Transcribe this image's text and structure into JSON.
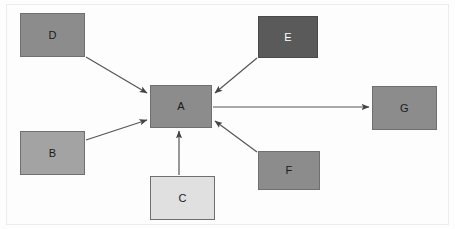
{
  "diagram": {
    "type": "node-link-graph",
    "title": "",
    "canvas": {
      "width": 455,
      "height": 229,
      "background": "#fdfdfd",
      "border_color": "#ececec"
    },
    "nodes": [
      {
        "id": "A",
        "label": "A",
        "x": 150,
        "y": 85,
        "width": 62,
        "height": 43,
        "fill": "#8c8c8c",
        "stroke": "#6f6f6f",
        "text_color": "#1a1a1a"
      },
      {
        "id": "B",
        "label": "B",
        "x": 20,
        "y": 131,
        "width": 65,
        "height": 44,
        "fill": "#a3a3a3",
        "stroke": "#6f6f6f",
        "text_color": "#1a1a1a"
      },
      {
        "id": "C",
        "label": "C",
        "x": 150,
        "y": 176,
        "width": 65,
        "height": 44,
        "fill": "#e0e0e0",
        "stroke": "#6f6f6f",
        "text_color": "#1a1a1a"
      },
      {
        "id": "D",
        "label": "D",
        "x": 20,
        "y": 13,
        "width": 65,
        "height": 44,
        "fill": "#8c8c8c",
        "stroke": "#6f6f6f",
        "text_color": "#1a1a1a"
      },
      {
        "id": "E",
        "label": "E",
        "x": 258,
        "y": 16,
        "width": 60,
        "height": 42,
        "fill": "#5a5a5a",
        "stroke": "#4a4a4a",
        "text_color": "#ffffff"
      },
      {
        "id": "F",
        "label": "F",
        "x": 258,
        "y": 151,
        "width": 62,
        "height": 39,
        "fill": "#8c8c8c",
        "stroke": "#6f6f6f",
        "text_color": "#1a1a1a"
      },
      {
        "id": "G",
        "label": "G",
        "x": 372,
        "y": 86,
        "width": 65,
        "height": 44,
        "fill": "#8c8c8c",
        "stroke": "#6f6f6f",
        "text_color": "#1a1a1a"
      }
    ],
    "edges": [
      {
        "id": "D-A",
        "from": "D",
        "to": "A",
        "x1": 86,
        "y1": 57,
        "x2": 147,
        "y2": 93,
        "directed": true
      },
      {
        "id": "B-A",
        "from": "B",
        "to": "A",
        "x1": 86,
        "y1": 140,
        "x2": 147,
        "y2": 120,
        "directed": true
      },
      {
        "id": "C-A",
        "from": "C",
        "to": "A",
        "x1": 179,
        "y1": 175,
        "x2": 179,
        "y2": 131,
        "directed": true
      },
      {
        "id": "E-A",
        "from": "E",
        "to": "A",
        "x1": 257,
        "y1": 58,
        "x2": 215,
        "y2": 93,
        "directed": true
      },
      {
        "id": "F-A",
        "from": "F",
        "to": "A",
        "x1": 257,
        "y1": 152,
        "x2": 215,
        "y2": 121,
        "directed": true
      },
      {
        "id": "A-G",
        "from": "A",
        "to": "G",
        "x1": 213,
        "y1": 107,
        "x2": 369,
        "y2": 107,
        "directed": true
      }
    ],
    "edge_style": {
      "color": "#555555",
      "width": 1.2,
      "arrow_color": "#444444"
    }
  }
}
